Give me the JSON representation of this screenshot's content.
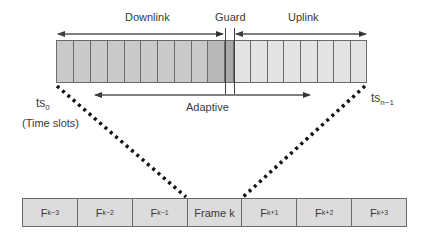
{
  "labels": {
    "downlink": "Downlink",
    "guard": "Guard",
    "uplink": "Uplink",
    "adaptive": "Adaptive",
    "ts_first_base": "ts",
    "ts_first_sub": "0",
    "ts_last_base": "ts",
    "ts_last_sub": "n−1",
    "time_slots": "(Time slots)"
  },
  "slots": {
    "downlink_count": 10,
    "guard_count": 1,
    "uplink_count": 8
  },
  "frames": [
    {
      "base": "F",
      "sub": "k−3"
    },
    {
      "base": "F",
      "sub": "k−2"
    },
    {
      "base": "F",
      "sub": "k−1"
    },
    {
      "base": "Frame k",
      "sub": ""
    },
    {
      "base": "F",
      "sub": "k+1"
    },
    {
      "base": "F",
      "sub": "k+2"
    },
    {
      "base": "F",
      "sub": "k+3"
    }
  ],
  "colors": {
    "downlink": "#c9c9c9",
    "guard": "#a9a9a9",
    "uplink": "#e3e3e3",
    "frame": "#dcdcdc",
    "line": "#6a6a6a"
  }
}
